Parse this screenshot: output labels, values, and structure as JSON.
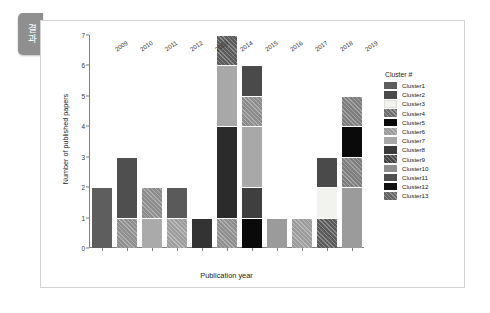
{
  "side_tab": {
    "label": "결과"
  },
  "chart_data": {
    "type": "bar",
    "subtype": "stacked-bar",
    "title": "",
    "xlabel": "Publication year",
    "ylabel": "Number of published papers",
    "categories": [
      "2009",
      "2010",
      "2011",
      "2012",
      "2013",
      "2014",
      "2015",
      "2016",
      "2017",
      "2018",
      "2019"
    ],
    "ylim": [
      0,
      7
    ],
    "yticks": [
      "0",
      "1",
      "2",
      "3",
      "4",
      "5",
      "6",
      "7"
    ],
    "grid": false,
    "legend": {
      "title": "Cluster #",
      "position": "right",
      "entries": [
        {
          "label": "Cluster1",
          "color": "#5e5e5e",
          "hatch": "none"
        },
        {
          "label": "Cluster2",
          "color": "#4a4a4a",
          "hatch": "none"
        },
        {
          "label": "Cluster3",
          "color": "#f2f2ef",
          "hatch": "none"
        },
        {
          "label": "Cluster4",
          "color": "#6e6e6e",
          "hatch": "diagonal"
        },
        {
          "label": "Cluster5",
          "color": "#0a0a0a",
          "hatch": "none"
        },
        {
          "label": "Cluster6",
          "color": "#9b9b9b",
          "hatch": "diagonal"
        },
        {
          "label": "Cluster7",
          "color": "#a8a8a8",
          "hatch": "none"
        },
        {
          "label": "Cluster8",
          "color": "#3a3a3a",
          "hatch": "none"
        },
        {
          "label": "Cluster9",
          "color": "#444444",
          "hatch": "diagonal"
        },
        {
          "label": "Cluster10",
          "color": "#8e8e8e",
          "hatch": "none"
        },
        {
          "label": "Cluster11",
          "color": "#4f4f4f",
          "hatch": "none"
        },
        {
          "label": "Cluster12",
          "color": "#111111",
          "hatch": "none"
        },
        {
          "label": "Cluster13",
          "color": "#626262",
          "hatch": "diagonal"
        }
      ]
    },
    "totals": [
      2,
      3,
      2,
      2,
      1,
      7,
      6,
      1,
      1,
      3,
      5
    ],
    "stacks": [
      {
        "year": "2009",
        "segments": [
          {
            "value": 2,
            "color": "#5e5e5e",
            "hatch": "none"
          }
        ]
      },
      {
        "year": "2010",
        "segments": [
          {
            "value": 1,
            "color": "#8e8e8e",
            "hatch": "diagonal"
          },
          {
            "value": 2,
            "color": "#4f4f4f",
            "hatch": "none"
          }
        ]
      },
      {
        "year": "2011",
        "segments": [
          {
            "value": 1,
            "color": "#aaaaaa",
            "hatch": "none"
          },
          {
            "value": 1,
            "color": "#8b8b8b",
            "hatch": "diagonal"
          }
        ]
      },
      {
        "year": "2012",
        "segments": [
          {
            "value": 1,
            "color": "#9d9d9d",
            "hatch": "diagonal"
          },
          {
            "value": 1,
            "color": "#5a5a5a",
            "hatch": "none"
          }
        ]
      },
      {
        "year": "2013",
        "segments": [
          {
            "value": 1,
            "color": "#333333",
            "hatch": "none"
          }
        ]
      },
      {
        "year": "2014",
        "segments": [
          {
            "value": 1,
            "color": "#8e8e8e",
            "hatch": "diagonal"
          },
          {
            "value": 3,
            "color": "#2b2b2b",
            "hatch": "none"
          },
          {
            "value": 2,
            "color": "#a8a8a8",
            "hatch": "none"
          },
          {
            "value": 1,
            "color": "#5a5a5a",
            "hatch": "diagonal"
          }
        ]
      },
      {
        "year": "2015",
        "segments": [
          {
            "value": 1,
            "color": "#0a0a0a",
            "hatch": "none"
          },
          {
            "value": 1,
            "color": "#3f3f3f",
            "hatch": "none"
          },
          {
            "value": 2,
            "color": "#a8a8a8",
            "hatch": "none"
          },
          {
            "value": 1,
            "color": "#8b8b8b",
            "hatch": "diagonal"
          },
          {
            "value": 1,
            "color": "#4a4a4a",
            "hatch": "none"
          }
        ]
      },
      {
        "year": "2016",
        "segments": [
          {
            "value": 1,
            "color": "#9b9b9b",
            "hatch": "none"
          }
        ]
      },
      {
        "year": "2017",
        "segments": [
          {
            "value": 1,
            "color": "#9b9b9b",
            "hatch": "diagonal"
          }
        ]
      },
      {
        "year": "2018",
        "segments": [
          {
            "value": 1,
            "color": "#5a5a5a",
            "hatch": "diagonal"
          },
          {
            "value": 1,
            "color": "#f2f2ef",
            "hatch": "none"
          },
          {
            "value": 1,
            "color": "#4a4a4a",
            "hatch": "none"
          }
        ]
      },
      {
        "year": "2019",
        "segments": [
          {
            "value": 2,
            "color": "#9b9b9b",
            "hatch": "none"
          },
          {
            "value": 1,
            "color": "#7d7d7d",
            "hatch": "diagonal"
          },
          {
            "value": 1,
            "color": "#0a0a0a",
            "hatch": "none"
          },
          {
            "value": 1,
            "color": "#7d7d7d",
            "hatch": "diagonal"
          }
        ]
      }
    ]
  }
}
